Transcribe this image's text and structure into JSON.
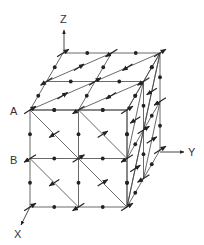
{
  "figure": {
    "type": "crystal-lattice-spin-diagram",
    "axes": {
      "x_label": "X",
      "y_label": "Y",
      "z_label": "Z"
    },
    "point_labels": {
      "a": "A",
      "b": "B"
    },
    "geometry": {
      "origin_front_top_left": [
        30,
        110
      ],
      "cell_size": 48.5,
      "depth_offset": [
        16.5,
        -28.5
      ],
      "cells": 2
    },
    "colors": {
      "line": "#444444",
      "dot": "#222222",
      "background": "#ffffff"
    }
  }
}
